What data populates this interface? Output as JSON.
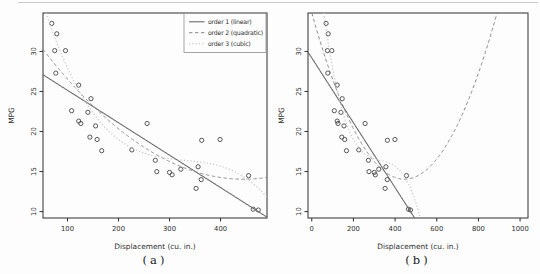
{
  "page": {
    "background": "#fdfdfd",
    "top_rule_color": "#c9c9c9"
  },
  "chart_data": {
    "type": "scatter",
    "title": "",
    "xlabel": "Displacement (cu. in.)",
    "ylabel": "MPG",
    "ylim": [
      9.2,
      34.8
    ],
    "yticks": [
      10,
      15,
      20,
      25,
      30
    ],
    "grid": false,
    "colors": {
      "axis": "#2f2f2f",
      "text": "#2f2f2f",
      "point": "#454545",
      "legend_border": "#8f8f8f"
    },
    "points": [
      [
        69,
        33.5
      ],
      [
        75,
        30.1
      ],
      [
        77,
        27.3
      ],
      [
        79,
        32.2
      ],
      [
        96,
        30.1
      ],
      [
        108,
        22.6
      ],
      [
        122,
        25.8
      ],
      [
        122,
        21.3
      ],
      [
        126,
        21.0
      ],
      [
        140,
        22.4
      ],
      [
        144,
        19.3
      ],
      [
        146,
        24.1
      ],
      [
        155,
        20.7
      ],
      [
        158,
        19.0
      ],
      [
        167,
        17.6
      ],
      [
        226,
        17.7
      ],
      [
        256,
        21.0
      ],
      [
        272,
        16.4
      ],
      [
        275,
        15.0
      ],
      [
        300,
        14.9
      ],
      [
        305,
        14.6
      ],
      [
        322,
        15.3
      ],
      [
        352,
        12.9
      ],
      [
        356,
        15.6
      ],
      [
        362,
        14.0
      ],
      [
        363,
        18.9
      ],
      [
        399,
        19.0
      ],
      [
        455,
        14.5
      ],
      [
        464,
        10.3
      ],
      [
        474,
        10.2
      ]
    ],
    "fits": [
      {
        "name": "order 1 (linear)",
        "style": "solid",
        "color": "#6a6a6a",
        "coeffs": [
          29.2,
          -0.0405
        ]
      },
      {
        "name": "order 2 (quadratic)",
        "style": "dashed",
        "color": "#828282",
        "coeffs": [
          34.84,
          -0.09345,
          0.000105
        ]
      },
      {
        "name": "order 3 (cubic)",
        "style": "dotted",
        "color": "#c8c8c8",
        "coeffs": [
          48.42,
          -0.279874,
          0.00083274,
          -8.4449e-07
        ]
      }
    ],
    "legend": {
      "position": "top-right",
      "entries": [
        "order 1 (linear)",
        "order 2 (quadratic)",
        "order 3 (cubic)"
      ]
    },
    "panels": [
      {
        "caption": "(a)",
        "xlim": [
          52,
          491
        ],
        "xticks": [
          100,
          200,
          300,
          400
        ],
        "show_legend": true
      },
      {
        "caption": "(b)",
        "xlim": [
          -18,
          1038
        ],
        "xticks": [
          0,
          200,
          400,
          600,
          800,
          1000
        ],
        "show_legend": false
      }
    ]
  }
}
